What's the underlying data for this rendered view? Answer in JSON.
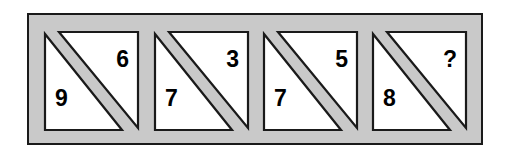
{
  "puzzle": {
    "type": "visual-analogy-number-puzzle",
    "panel_count": 4,
    "missing_symbol": "?",
    "colors": {
      "frame_fill": "#c9c9c9",
      "frame_border": "#1a1a1a",
      "panel_fill": "#ffffff",
      "panel_border": "#1a1a1a",
      "divider_band": "#c9c9c9",
      "digit": "#000000",
      "page_background": "#ffffff"
    },
    "panels": [
      {
        "index": 1,
        "name": "panel-1",
        "top_right": "6",
        "bottom_left": "9"
      },
      {
        "index": 2,
        "name": "panel-2",
        "top_right": "3",
        "bottom_left": "7"
      },
      {
        "index": 3,
        "name": "panel-3",
        "top_right": "5",
        "bottom_left": "7"
      },
      {
        "index": 4,
        "name": "panel-4",
        "top_right": "?",
        "bottom_left": "8"
      }
    ]
  }
}
